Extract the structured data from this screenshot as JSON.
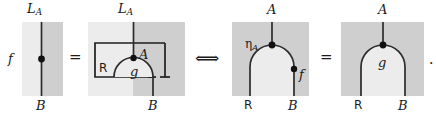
{
  "figure": {
    "type": "string-diagram-equation",
    "background": "#ffffff",
    "colors": {
      "region_light": "#ececec",
      "region_dark": "#cfcfcf",
      "wire": "#2b2b2b",
      "text": "#1a1a1a"
    },
    "panels": [
      {
        "id": "panel-1",
        "name": "morphism-f-on-wire",
        "top_label": "L",
        "top_label_sub": "A",
        "bottom_label": "B",
        "node_label": "f",
        "node_label_side": "left",
        "regions": [
          "light",
          "dark"
        ]
      },
      {
        "id": "panel-2",
        "name": "boxed-cap-with-g",
        "top_label": "L",
        "top_label_sub": "A",
        "bottom_label": "B",
        "inner_left_label": "R",
        "inner_wire_label": "A",
        "node_label": "g",
        "regions": [
          "light",
          "dark"
        ]
      },
      {
        "id": "panel-3",
        "name": "unit-eta-cap-with-f",
        "top_label": "A",
        "bottom_left_label": "R",
        "bottom_right_label": "B",
        "unit_label": "η",
        "unit_label_sub": "A",
        "node_label": "f",
        "regions": [
          "dark",
          "light"
        ]
      },
      {
        "id": "panel-4",
        "name": "cap-with-g",
        "top_label": "A",
        "bottom_left_label": "R",
        "bottom_right_label": "B",
        "node_label": "g",
        "regions": [
          "dark",
          "light"
        ]
      }
    ],
    "relations": [
      {
        "id": "rel-1",
        "name": "equals-sign-1",
        "glyph": "="
      },
      {
        "id": "rel-2",
        "name": "iff-double-arrow",
        "glyph": "⟺"
      },
      {
        "id": "rel-3",
        "name": "equals-sign-2",
        "glyph": "="
      }
    ],
    "trailing_punctuation": "."
  }
}
